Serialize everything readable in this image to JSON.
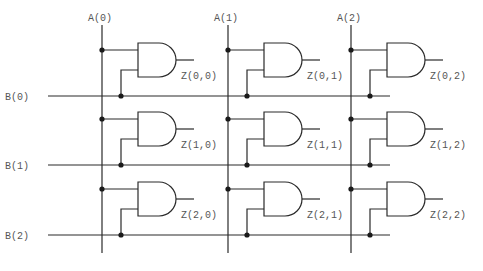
{
  "diagram": {
    "type": "AND-gate multiplier array",
    "columns": [
      {
        "label": "A(0)",
        "x": 102
      },
      {
        "label": "A(1)",
        "x": 228
      },
      {
        "label": "A(2)",
        "x": 351
      }
    ],
    "rows": [
      {
        "label": "B(0)",
        "y": 96
      },
      {
        "label": "B(1)",
        "y": 165
      },
      {
        "label": "B(2)",
        "y": 235
      }
    ],
    "gates": [
      [
        "Z(0,0)",
        "Z(0,1)",
        "Z(0,2)"
      ],
      [
        "Z(1,0)",
        "Z(1,1)",
        "Z(1,2)"
      ],
      [
        "Z(2,0)",
        "Z(2,1)",
        "Z(2,2)"
      ]
    ],
    "colors": {
      "line": "#2a2a2a",
      "text": "#555555",
      "background": "#ffffff"
    }
  }
}
